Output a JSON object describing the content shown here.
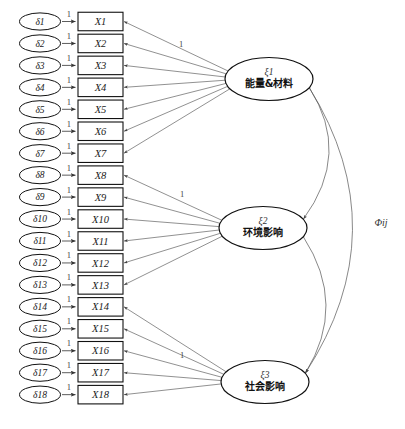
{
  "diagram": {
    "indicators": [
      {
        "id": "X1",
        "label": "X1"
      },
      {
        "id": "X2",
        "label": "X2"
      },
      {
        "id": "X3",
        "label": "X3"
      },
      {
        "id": "X4",
        "label": "X4"
      },
      {
        "id": "X5",
        "label": "X5"
      },
      {
        "id": "X6",
        "label": "X6"
      },
      {
        "id": "X7",
        "label": "X7"
      },
      {
        "id": "X8",
        "label": "X8"
      },
      {
        "id": "X9",
        "label": "X9"
      },
      {
        "id": "X10",
        "label": "X10"
      },
      {
        "id": "X11",
        "label": "X11"
      },
      {
        "id": "X12",
        "label": "X12"
      },
      {
        "id": "X13",
        "label": "X13"
      },
      {
        "id": "X14",
        "label": "X14"
      },
      {
        "id": "X15",
        "label": "X15"
      },
      {
        "id": "X16",
        "label": "X16"
      },
      {
        "id": "X17",
        "label": "X17"
      },
      {
        "id": "X18",
        "label": "X18"
      }
    ],
    "errors": [
      {
        "id": "d1",
        "label": "δ1"
      },
      {
        "id": "d2",
        "label": "δ2"
      },
      {
        "id": "d3",
        "label": "δ3"
      },
      {
        "id": "d4",
        "label": "δ4"
      },
      {
        "id": "d5",
        "label": "δ5"
      },
      {
        "id": "d6",
        "label": "δ6"
      },
      {
        "id": "d7",
        "label": "δ7"
      },
      {
        "id": "d8",
        "label": "δ8"
      },
      {
        "id": "d9",
        "label": "δ9"
      },
      {
        "id": "d10",
        "label": "δ10"
      },
      {
        "id": "d11",
        "label": "δ11"
      },
      {
        "id": "d12",
        "label": "δ12"
      },
      {
        "id": "d13",
        "label": "δ13"
      },
      {
        "id": "d14",
        "label": "δ14"
      },
      {
        "id": "d15",
        "label": "δ15"
      },
      {
        "id": "d16",
        "label": "δ16"
      },
      {
        "id": "d17",
        "label": "δ17"
      },
      {
        "id": "d18",
        "label": "δ18"
      }
    ],
    "error_path_label": "1",
    "latents": [
      {
        "id": "xi1",
        "symbol": "ξ1",
        "name": "能量&材料",
        "fixed_loading_label": "1",
        "indicators": [
          "X1",
          "X2",
          "X3",
          "X4",
          "X5",
          "X6",
          "X7"
        ]
      },
      {
        "id": "xi2",
        "symbol": "ξ2",
        "name": "环境影响",
        "fixed_loading_label": "1",
        "indicators": [
          "X8",
          "X9",
          "X10",
          "X11",
          "X12",
          "X13"
        ]
      },
      {
        "id": "xi3",
        "symbol": "ξ3",
        "name": "社会影响",
        "fixed_loading_label": "1",
        "indicators": [
          "X14",
          "X15",
          "X16",
          "X17",
          "X18"
        ]
      }
    ],
    "covariances": [
      {
        "from": "xi1",
        "to": "xi2",
        "label": ""
      },
      {
        "from": "xi2",
        "to": "xi3",
        "label": ""
      },
      {
        "from": "xi1",
        "to": "xi3",
        "label": "Φij"
      }
    ],
    "covariance_label": "Φij",
    "colors": {
      "background": "#ffffff",
      "stroke": "#111111",
      "edge": "#555555",
      "text": "#111111"
    }
  }
}
